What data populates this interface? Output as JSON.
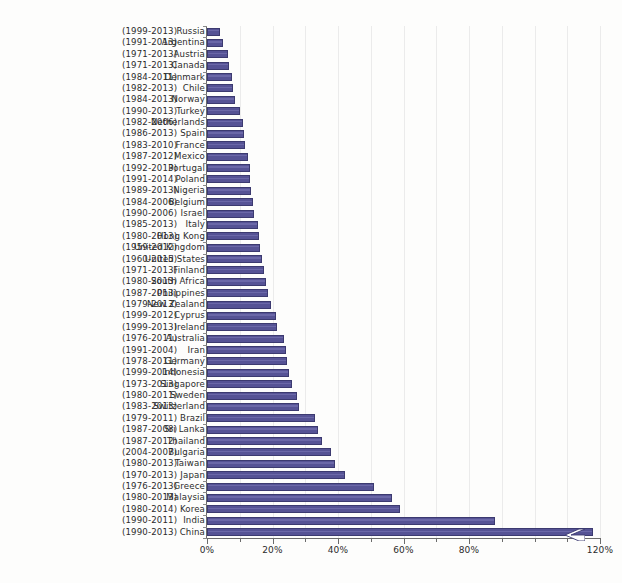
{
  "chart_data": {
    "type": "bar",
    "orientation": "horizontal",
    "title": "",
    "xlabel": "",
    "ylabel": "",
    "xlim": [
      0,
      120
    ],
    "xticks": [
      0,
      20,
      40,
      60,
      80,
      120
    ],
    "xtick_labels": [
      "0%",
      "20%",
      "40%",
      "60%",
      "80%",
      "120%"
    ],
    "minor_tick_step": 10,
    "grid": "vertical",
    "legend": "none",
    "axis_break": {
      "present": true,
      "series_index": 44,
      "note": "zigzag break mark drawn near the right end of the China bar"
    },
    "bar_color": "#565395",
    "bar_edge_color": "#3c3a70",
    "categories": [
      "Russia",
      "Argentina",
      "Austria",
      "Canada",
      "Denmark",
      "Chile",
      "Norway",
      "Turkey",
      "Netherlands",
      "Spain",
      "France",
      "Mexico",
      "Portugal",
      "Poland",
      "Nigeria",
      "Belgium",
      "Israel",
      "Italy",
      "Hong Kong",
      "United Kingdom",
      "United States",
      "Finland",
      "South Africa",
      "Philippines",
      "New Zealand",
      "Cyprus",
      "Ireland",
      "Australia",
      "Iran",
      "Germany",
      "Indonesia",
      "Singapore",
      "Sweden",
      "Switzerland",
      "Brazil",
      "Sri Lanka",
      "Thailand",
      "Bulgaria",
      "Taiwan",
      "Japan",
      "Greece",
      "Malaysia",
      "Korea",
      "India",
      "China"
    ],
    "year_ranges": [
      "(1999-2013)",
      "(1991-2013)",
      "(1971-2013)",
      "(1971-2013)",
      "(1984-2011)",
      "(1982-2013)",
      "(1984-2013)",
      "(1990-2013)",
      "(1982-2006)",
      "(1986-2013)",
      "(1983-2010)",
      "(1987-2012)",
      "(1992-2013)",
      "(1991-2014)",
      "(1989-2013)",
      "(1984-2006)",
      "(1990-2006)",
      "(1985-2013)",
      "(1980-2013)",
      "(1959-2012)",
      "(1960-2015)",
      "(1971-2013)",
      "(1980-2013)",
      "(1987-2013)",
      "(1979-2013)",
      "(1999-2012)",
      "(1999-2013)",
      "(1976-2011)",
      "(1991-2004)",
      "(1978-2011)",
      "(1999-2014)",
      "(1973-2013)",
      "(1980-2011)",
      "(1983-2013)",
      "(1979-2011)",
      "(1987-2008)",
      "(1987-2012)",
      "(2004-2007)",
      "(1980-2013)",
      "(1970-2013)",
      "(1976-2013)",
      "(1980-2013)",
      "(1980-2014)",
      "(1990-2011)",
      "(1990-2013)"
    ],
    "values": [
      4.0,
      5.0,
      6.5,
      6.8,
      7.5,
      8.0,
      8.5,
      10.0,
      11.0,
      11.2,
      11.5,
      12.5,
      13.0,
      13.2,
      13.5,
      14.0,
      14.3,
      15.5,
      16.0,
      16.3,
      16.8,
      17.5,
      18.0,
      18.5,
      19.5,
      21.0,
      21.5,
      23.5,
      24.0,
      24.3,
      25.0,
      26.0,
      27.5,
      28.0,
      33.0,
      34.0,
      35.0,
      38.0,
      39.0,
      42.0,
      51.0,
      56.5,
      59.0,
      88.0,
      118.0
    ],
    "value_unit": "%"
  }
}
